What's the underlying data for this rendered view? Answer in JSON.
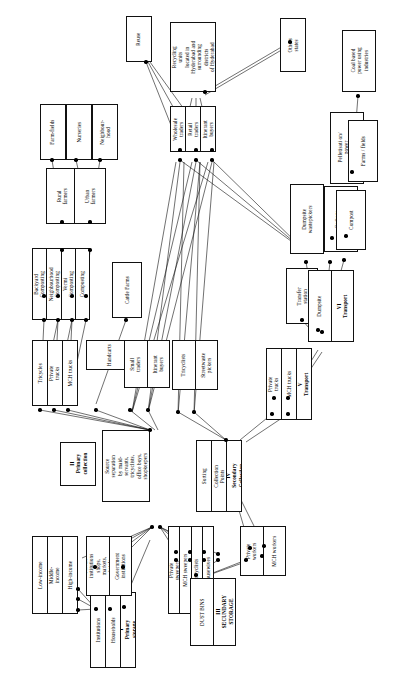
{
  "diagram": {
    "orientation": "rotated-90",
    "type": "flow-diagram",
    "stroke_color": "#111111",
    "background_color": "#ffffff",
    "node_fill": "#ffffff"
  },
  "stages": [
    {
      "id": "stage1",
      "numeral": "I",
      "name": "Primary storage"
    },
    {
      "id": "stage2",
      "numeral": "II",
      "name": "Primary collection"
    },
    {
      "id": "stage3",
      "numeral": "III",
      "name": "SECONDARY STORAGE"
    },
    {
      "id": "stage4",
      "numeral": "IV",
      "name": "Secondary Collection"
    },
    {
      "id": "stage5",
      "numeral": "V",
      "name": "Transport"
    },
    {
      "id": "stage6",
      "numeral": "VI",
      "name": "Transport"
    }
  ],
  "groups": [
    {
      "id": "g-primary-storage",
      "name": "primary-storage-stage",
      "cells": [
        {
          "text": "I\nPrimary\nstorage",
          "bold": true
        },
        {
          "text": "Households"
        },
        {
          "text": "Institutions"
        }
      ]
    },
    {
      "id": "g-income",
      "name": "household-income-groups",
      "cells": [
        {
          "text": "High-income"
        },
        {
          "text": "Middle-\nincome"
        },
        {
          "text": "Low-income"
        }
      ]
    },
    {
      "id": "g-institutions",
      "name": "institution-types",
      "cells": [
        {
          "text": "Government\ninstitutions"
        },
        {
          "text": "Private\ninstitutions\nshops,\nmarkets,\nhotels"
        }
      ]
    },
    {
      "id": "g-separators",
      "name": "source-separation-actors",
      "cells": [
        {
          "text": "Housewives"
        },
        {
          "text": "Tricyclists"
        },
        {
          "text": "MCH sweepers"
        },
        {
          "text": "Private\nsweepers"
        }
      ]
    },
    {
      "id": "g-secondary-storage",
      "name": "secondary-storage-stage",
      "cells": [
        {
          "text": "III\nSECUNDARY\nSTORAGE",
          "bold": true
        },
        {
          "text": "DUST BINS"
        }
      ]
    },
    {
      "id": "g-mch-workers",
      "name": "mch-workers",
      "cells": [
        {
          "text": "MCH workers"
        },
        {
          "text": "Private\nworkers"
        }
      ]
    },
    {
      "id": "g-primary-collection",
      "name": "primary-collection-stage",
      "cells": [
        {
          "text": "II\nPrimary\ncollection",
          "bold": true
        }
      ]
    },
    {
      "id": "g-source-separation",
      "name": "source-separation-note",
      "cells": [
        {
          "text": "Source\nseparation\nby maid-\nservants,\ntricyclists,\noffice boys,\nshopkeepers"
        }
      ]
    },
    {
      "id": "g-vehicles",
      "name": "primary-collection-vehicles",
      "cells": [
        {
          "text": "MCH trucks"
        },
        {
          "text": "Private\ntrucks"
        },
        {
          "text": "Tricycles"
        }
      ]
    },
    {
      "id": "g-handcarts",
      "name": "handcarts",
      "cells": [
        {
          "text": "Handcarts"
        }
      ]
    },
    {
      "id": "g-itinerant-small",
      "name": "itinerant-buyers-small-traders",
      "cells": [
        {
          "text": "Itinerant\nbuyers"
        },
        {
          "text": "Small\ntraders"
        }
      ]
    },
    {
      "id": "g-streetwaste",
      "name": "streetwaste-pickers",
      "cells": [
        {
          "text": "Streetwaste\npickers"
        },
        {
          "text": "Tricyclists"
        }
      ]
    },
    {
      "id": "g-secondary-collection",
      "name": "secondary-collection-stage",
      "cells": [
        {
          "text": "IV\nSecondary\nCollection",
          "bold": true
        },
        {
          "text": "Collection\nPoints"
        },
        {
          "text": "Sorting"
        }
      ]
    },
    {
      "id": "g-transport5",
      "name": "transport-stage-five",
      "cells": [
        {
          "text": "V\nTransport",
          "bold": true
        },
        {
          "text": "MCH trucks"
        },
        {
          "text": "Private\ntrucks"
        }
      ]
    },
    {
      "id": "g-transfer",
      "name": "transfer-station",
      "cells": [
        {
          "text": "Transfer\nstation"
        }
      ]
    },
    {
      "id": "g-transport6",
      "name": "transport-stage-six",
      "cells": [
        {
          "text": "VI\nTransport",
          "bold": true
        },
        {
          "text": "Dumpsite"
        }
      ]
    },
    {
      "id": "g-dumpsite-pickers",
      "name": "dumpsite-wastepickers",
      "cells": [
        {
          "text": "Dumpsite\nwastepickers"
        }
      ]
    },
    {
      "id": "g-garbage-plants",
      "name": "garbage-processing-plants",
      "cells": [
        {
          "text": "Garbage\nprocessing plants"
        }
      ]
    },
    {
      "id": "g-compost",
      "name": "compost",
      "cells": [
        {
          "text": "Compost"
        }
      ]
    },
    {
      "id": "g-pelletisation",
      "name": "pelletisation-power-generation",
      "cells": [
        {
          "text": "Pelletisati on/\npower\ngeneration"
        }
      ]
    },
    {
      "id": "g-farms-fields-right",
      "name": "farms-fields-destination",
      "cells": [
        {
          "text": "Farms / fields"
        }
      ]
    },
    {
      "id": "g-coal",
      "name": "coal-based-power-industries",
      "cells": [
        {
          "text": "Coal based\npower using\nindustries"
        }
      ]
    },
    {
      "id": "g-cattle",
      "name": "cattle-farms",
      "cells": [
        {
          "text": "Cattle Farms"
        }
      ]
    },
    {
      "id": "g-composting",
      "name": "composting-methods",
      "cells": [
        {
          "text": "Composting"
        },
        {
          "text": "Vermi\nComposting"
        },
        {
          "text": "Neighbourhood\nComposting"
        },
        {
          "text": "Backyard\nComposting"
        }
      ]
    },
    {
      "id": "g-rural",
      "name": "rural-farmers",
      "cells": [
        {
          "text": "Rural\nfarmers"
        }
      ]
    },
    {
      "id": "g-urban",
      "name": "urban-farmers",
      "cells": [
        {
          "text": "Urban\nfarmers"
        }
      ]
    },
    {
      "id": "g-farmfields",
      "name": "farm-fields",
      "cells": [
        {
          "text": "Farm-fields"
        }
      ]
    },
    {
      "id": "g-nurseries",
      "name": "nurseries",
      "cells": [
        {
          "text": "Nurseries"
        }
      ]
    },
    {
      "id": "g-neighbourhood",
      "name": "neighbourhood",
      "cells": [
        {
          "text": "Neighbour-\nhood"
        }
      ]
    },
    {
      "id": "g-traders",
      "name": "traders-group",
      "cells": [
        {
          "text": "Itinerant\nbuyers"
        },
        {
          "text": "Retail\ntraders"
        },
        {
          "text": "Wholesale\ntraders"
        }
      ]
    },
    {
      "id": "g-reuse",
      "name": "reuse",
      "cells": [
        {
          "text": "Reuse"
        }
      ]
    },
    {
      "id": "g-recycling",
      "name": "recycling-units",
      "cells": [
        {
          "text": "Recycling\nunits\nlocated in\nHyderabad and\nsurrounding\ndistricts\nof Hyderabad"
        }
      ]
    },
    {
      "id": "g-other-states",
      "name": "other-states",
      "cells": [
        {
          "text": "Others\nstates"
        }
      ]
    }
  ]
}
